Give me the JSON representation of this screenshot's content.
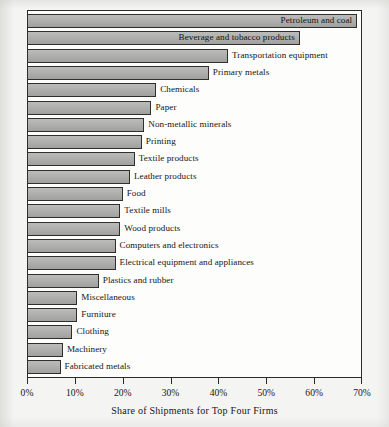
{
  "chart_data": {
    "type": "bar",
    "orientation": "horizontal",
    "title": "",
    "xlabel": "Share of Shipments for Top Four Firms",
    "ylabel": "",
    "xlim": [
      0,
      70
    ],
    "xtick_labels": [
      "0%",
      "10%",
      "20%",
      "30%",
      "40%",
      "50%",
      "60%",
      "70%"
    ],
    "xtick_values": [
      0,
      10,
      20,
      30,
      40,
      50,
      60,
      70
    ],
    "grid": false,
    "legend": "none",
    "value_unit": "percent",
    "bar_color": "#a9a9a6",
    "bar_border_color": "#2f2f2f",
    "plot_background": "#fdfdfc",
    "page_background": "#f4f4f2",
    "categories": [
      "Petroleum and coal",
      "Beverage and tobacco products",
      "Transportation equipment",
      "Primary metals",
      "Chemicals",
      "Paper",
      "Non-metallic minerals",
      "Printing",
      "Textile products",
      "Leather products",
      "Food",
      "Textile mills",
      "Wood products",
      "Computers and electronics",
      "Electrical equipment and appliances",
      "Plastics and rubber",
      "Miscellaneous",
      "Furniture",
      "Clothing",
      "Machinery",
      "Fabricated metals"
    ],
    "values": [
      69,
      57,
      42,
      38,
      27,
      26,
      24.5,
      24,
      22.5,
      21.5,
      20,
      19.5,
      19.5,
      18.5,
      18.5,
      15,
      10.5,
      10.5,
      9.5,
      7.5,
      7
    ],
    "label_placement": [
      "inside",
      "inside",
      "outside",
      "outside",
      "outside",
      "outside",
      "outside",
      "outside",
      "outside",
      "outside",
      "outside",
      "outside",
      "outside",
      "outside",
      "outside",
      "outside",
      "outside",
      "outside",
      "outside",
      "outside",
      "outside"
    ]
  }
}
